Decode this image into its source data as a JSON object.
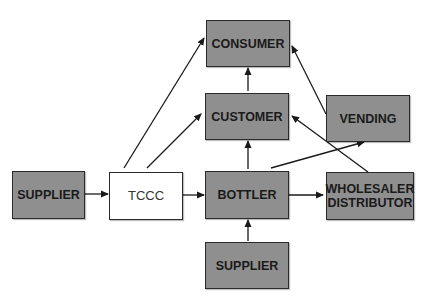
{
  "diagram": {
    "type": "flowchart",
    "nodes": {
      "consumer": {
        "label": "CONSUMER"
      },
      "customer": {
        "label": "CUSTOMER"
      },
      "vending": {
        "label": "VENDING"
      },
      "supplier_left": {
        "label": "SUPPLIER"
      },
      "tccc": {
        "label": "TCCC"
      },
      "bottler": {
        "label": "BOTTLER"
      },
      "wholesaler_line1": {
        "label": "WHOLESALER"
      },
      "wholesaler_line2": {
        "label": "DISTRIBUTOR"
      },
      "supplier_bottom": {
        "label": "SUPPLIER"
      }
    },
    "edges": [
      {
        "from": "SUPPLIER (left)",
        "to": "TCCC"
      },
      {
        "from": "TCCC",
        "to": "BOTTLER"
      },
      {
        "from": "TCCC",
        "to": "CONSUMER"
      },
      {
        "from": "TCCC",
        "to": "CUSTOMER"
      },
      {
        "from": "BOTTLER",
        "to": "CUSTOMER"
      },
      {
        "from": "BOTTLER",
        "to": "WHOLESALER DISTRIBUTOR"
      },
      {
        "from": "BOTTLER",
        "to": "VENDING"
      },
      {
        "from": "CUSTOMER",
        "to": "CONSUMER"
      },
      {
        "from": "VENDING",
        "to": "CONSUMER"
      },
      {
        "from": "WHOLESALER DISTRIBUTOR",
        "to": "CUSTOMER"
      },
      {
        "from": "SUPPLIER (bottom)",
        "to": "BOTTLER"
      }
    ],
    "colors": {
      "node_fill": "#8f8f8f",
      "tccc_fill": "#ffffff",
      "stroke": "#2a2a2a"
    }
  }
}
